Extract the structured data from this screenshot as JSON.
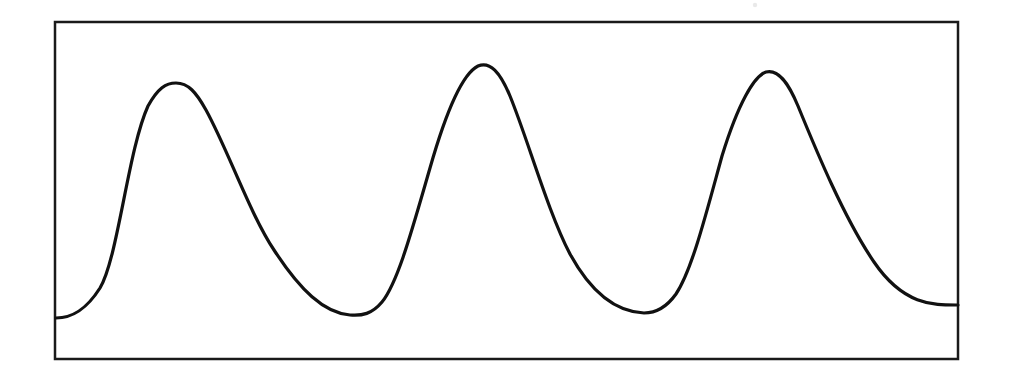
{
  "figure": {
    "background_color": "#ffffff",
    "frame": {
      "name": "plot-border",
      "x": 55,
      "y": 22,
      "width": 903,
      "height": 337,
      "stroke_color": "#1a1a1a",
      "stroke_width": 2.5,
      "fill_color": "#ffffff"
    },
    "curve": {
      "name": "sinusoidal-curve",
      "stroke_color": "#111111",
      "stroke_width": 3.2,
      "fill": "none"
    },
    "artifact": {
      "name": "scan-speck",
      "x": 755,
      "y": 5,
      "radius": 2.2,
      "color": "#9a9a9a"
    }
  },
  "chart_data": {
    "type": "line",
    "title": "",
    "subtitle": "",
    "xlabel": "",
    "ylabel": "",
    "grid": false,
    "legend": null,
    "axis_ticks": [],
    "tick_labels": [],
    "annotations": [],
    "xlim": [
      0,
      903
    ],
    "ylim": [
      0,
      337
    ],
    "y_inverted": true,
    "key_points": [
      {
        "label": "start",
        "x": 56,
        "y": 318
      },
      {
        "label": "peak-1",
        "x": 175,
        "y": 83
      },
      {
        "label": "trough-1",
        "x": 368,
        "y": 313
      },
      {
        "label": "peak-2",
        "x": 480,
        "y": 66
      },
      {
        "label": "trough-2",
        "x": 658,
        "y": 310
      },
      {
        "label": "peak-3",
        "x": 768,
        "y": 72
      },
      {
        "label": "end",
        "x": 958,
        "y": 305
      }
    ],
    "x": [
      56,
      175,
      368,
      480,
      658,
      768,
      958
    ],
    "y": [
      318,
      83,
      313,
      66,
      310,
      72,
      305
    ],
    "series": [
      {
        "name": "wave",
        "x": [
          56,
          175,
          368,
          480,
          658,
          768,
          958
        ],
        "values": [
          318,
          83,
          313,
          66,
          310,
          72,
          305
        ]
      }
    ],
    "path_d": "M 56,318 C 72,318 86,310 100,288 C 118,258 128,150 148,106 C 158,88 166,83 176,83 C 188,83 196,92 206,110 C 228,150 250,214 274,250 C 300,290 324,313 350,315 C 362,316 372,314 382,302 C 398,282 412,230 430,168 C 446,112 462,74 478,66 C 490,61 500,72 510,96 C 528,140 548,212 570,254 C 594,298 620,312 644,313 C 656,313 666,308 676,294 C 692,270 706,214 722,156 C 738,104 754,76 766,72 C 778,69 788,82 798,106 C 816,150 844,218 874,262 C 904,306 934,305 958,305"
  }
}
